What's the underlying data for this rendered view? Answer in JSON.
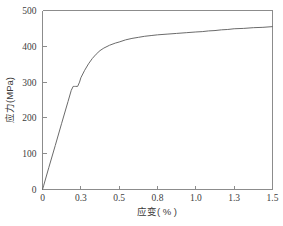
{
  "chart_data": {
    "type": "line",
    "title": "",
    "subtitle": "",
    "xlabel": "应变( % )",
    "ylabel": "应力(MPa)",
    "xlim": [
      0,
      1.5
    ],
    "ylim": [
      0,
      500
    ],
    "grid": false,
    "legend": null,
    "x_tick_labels": [
      "0",
      "0.3",
      "0.5",
      "0.8",
      "1.0",
      "1.3",
      "1.5"
    ],
    "x_tick_values": [
      0,
      0.3,
      0.5,
      0.8,
      1.0,
      1.3,
      1.5
    ],
    "y_tick_labels": [
      "0",
      "100",
      "200",
      "300",
      "400",
      "500"
    ],
    "y_tick_values": [
      0,
      100,
      200,
      300,
      400,
      500
    ],
    "axis_note": "x ticks are evenly spaced by index, not by numeric value",
    "series": [
      {
        "name": "应力-应变曲线",
        "color": "#6b6b6b",
        "x": [
          0.0,
          0.01,
          0.05,
          0.1,
          0.15,
          0.2,
          0.225,
          0.24,
          0.25,
          0.26,
          0.275,
          0.29,
          0.3,
          0.32,
          0.34,
          0.36,
          0.38,
          0.4,
          0.42,
          0.45,
          0.48,
          0.5,
          0.55,
          0.6,
          0.65,
          0.7,
          0.75,
          0.8,
          0.85,
          0.9,
          0.95,
          1.0,
          1.05,
          1.1,
          1.15,
          1.2,
          1.25,
          1.3,
          1.35,
          1.4,
          1.45,
          1.5
        ],
        "y": [
          0,
          12,
          62,
          123,
          185,
          246,
          277,
          288,
          288,
          288,
          288,
          300,
          312,
          333,
          351,
          366,
          378,
          388,
          395,
          403,
          409,
          412,
          418,
          422,
          425,
          428,
          430,
          432,
          434,
          436,
          438,
          440,
          441,
          443,
          444,
          446,
          447,
          449,
          450,
          452,
          453,
          455
        ]
      }
    ],
    "annotations": [
      {
        "label": "yield-plateau",
        "stress": 288,
        "strain_range": [
          0.225,
          0.29
        ]
      },
      {
        "label": "ultimate-end-point",
        "strain": 1.5,
        "stress": 455
      }
    ]
  }
}
